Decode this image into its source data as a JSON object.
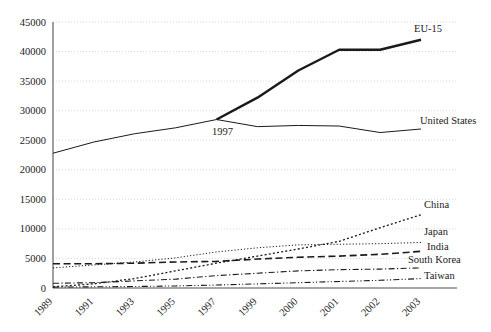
{
  "chart_data": {
    "type": "line",
    "title": "",
    "xlabel": "",
    "ylabel": "",
    "ylim": [
      0,
      45000
    ],
    "ytick_step": 5000,
    "grid": true,
    "legend_position": "right-inline-labels",
    "categories": [
      "1989",
      "1991",
      "1993",
      "1995",
      "1997",
      "1999",
      "2000",
      "2001",
      "2002",
      "2003"
    ],
    "yticks": [
      "0",
      "5000",
      "10000",
      "15000",
      "20000",
      "25000",
      "30000",
      "35000",
      "40000",
      "45000"
    ],
    "annotations": [
      {
        "text": "1997",
        "category": "1997",
        "value": 28500
      }
    ],
    "series": [
      {
        "name": "EU-15",
        "label": "EU-15",
        "style": "solid-thick",
        "width": 2.4,
        "color": "#1a1a1a",
        "values": [
          null,
          null,
          null,
          null,
          28500,
          32200,
          36800,
          40300,
          40300,
          42000
        ]
      },
      {
        "name": "United States",
        "label": "United States",
        "style": "solid-thin",
        "width": 1.0,
        "color": "#555555",
        "values": [
          22800,
          24700,
          26100,
          27100,
          28500,
          27300,
          27500,
          27400,
          26300,
          26900
        ]
      },
      {
        "name": "China",
        "label": "China",
        "style": "dotted",
        "width": 1.3,
        "color": "#1a1a1a",
        "values": [
          200,
          700,
          1600,
          2900,
          4200,
          5400,
          6600,
          7900,
          10200,
          12400
        ]
      },
      {
        "name": "Japan",
        "label": "Japan",
        "style": "fine-dotted",
        "width": 1.0,
        "color": "#1a1a1a",
        "values": [
          3400,
          3900,
          4400,
          5100,
          6100,
          6800,
          7300,
          7400,
          7500,
          7700
        ]
      },
      {
        "name": "India",
        "label": "India",
        "style": "long-dash",
        "width": 1.6,
        "color": "#1a1a1a",
        "values": [
          4100,
          4100,
          4200,
          4400,
          4500,
          4900,
          5200,
          5400,
          5700,
          6200
        ]
      },
      {
        "name": "South Korea",
        "label": "South Korea",
        "style": "dash-dot",
        "width": 1.1,
        "color": "#1a1a1a",
        "values": [
          800,
          900,
          1200,
          1500,
          2100,
          2500,
          2900,
          3100,
          3200,
          3400
        ]
      },
      {
        "name": "Taiwan",
        "label": "Taiwan",
        "style": "dash-dot-dot",
        "width": 1.1,
        "color": "#1a1a1a",
        "values": [
          150,
          200,
          250,
          350,
          500,
          700,
          900,
          1100,
          1300,
          1600
        ]
      }
    ]
  },
  "axes": {
    "y_axis_name": "y-axis",
    "x_axis_name": "x-axis"
  }
}
